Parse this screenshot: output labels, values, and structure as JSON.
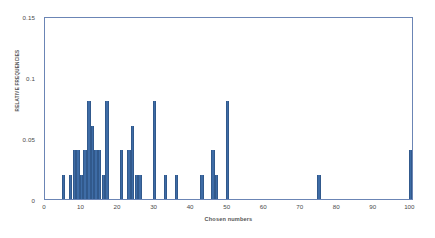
{
  "chart_data": {
    "type": "bar",
    "title": "",
    "subtitle": "",
    "xlabel": "Chosen numbers",
    "ylabel": "RELATIVE FREQUENCIES",
    "xlim": [
      0,
      101
    ],
    "ylim": [
      0,
      0.15
    ],
    "grid": false,
    "legend": null,
    "bar_color": "#3e6ca6",
    "plot_border_color": "#6b85b5",
    "xticks": [
      0,
      10,
      20,
      30,
      40,
      50,
      60,
      70,
      80,
      90,
      100
    ],
    "xtick_labels": [
      "0",
      "10",
      "20",
      "30",
      "40",
      "50",
      "60",
      "70",
      "80",
      "90",
      "100"
    ],
    "yticks": [
      0,
      0.05,
      0.1,
      0.15
    ],
    "ytick_labels": [
      "0",
      "0.05",
      "0.1",
      "0.15"
    ],
    "categories": [
      5,
      7,
      8,
      9,
      10,
      11,
      12,
      13,
      14,
      15,
      16,
      17,
      21,
      23,
      24,
      25,
      26,
      30,
      33,
      36,
      43,
      46,
      47,
      50,
      75,
      100
    ],
    "values": [
      0.02,
      0.02,
      0.04,
      0.04,
      0.02,
      0.04,
      0.08,
      0.06,
      0.04,
      0.04,
      0.02,
      0.08,
      0.04,
      0.04,
      0.06,
      0.02,
      0.02,
      0.08,
      0.02,
      0.02,
      0.02,
      0.04,
      0.02,
      0.08,
      0.02,
      0.04
    ]
  }
}
